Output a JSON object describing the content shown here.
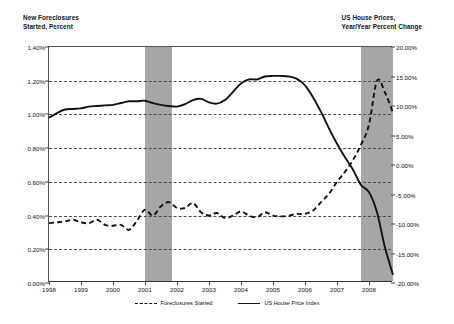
{
  "axes": {
    "left_title": "New Foreclosures\nStarted, Percent",
    "right_title": "US House Prices,\nYear/Year Percent Change"
  },
  "legend": {
    "items": [
      {
        "label": "Foreclosures Started",
        "style": "dashed"
      },
      {
        "label": "US House Price Index",
        "style": "solid"
      }
    ]
  },
  "chart_data": {
    "type": "line",
    "title": "",
    "subtitle": "",
    "xlabel": "",
    "ylabel": "New Foreclosures Started, Percent",
    "y2label": "US House Prices, Year/Year Percent Change",
    "grid": true,
    "legend_position": "bottom",
    "xlim": [
      1998.0,
      2008.75
    ],
    "x_tick_labels": [
      "1998",
      "1999",
      "2000",
      "2001",
      "2002",
      "2003",
      "2004",
      "2005",
      "2006",
      "2007",
      "2008"
    ],
    "x_ticks": [
      1998,
      1999,
      2000,
      2001,
      2002,
      2003,
      2004,
      2005,
      2006,
      2007,
      2008
    ],
    "ylim": [
      0.0,
      1.4
    ],
    "y_tick_labels": [
      "0.00%",
      "0.20%",
      "0.40%",
      "0.60%",
      "0.80%",
      "1.00%",
      "1.20%",
      "1.40%"
    ],
    "y_ticks": [
      0.0,
      0.2,
      0.4,
      0.6,
      0.8,
      1.0,
      1.2,
      1.4
    ],
    "y2lim": [
      -20.0,
      20.0
    ],
    "y2_tick_labels": [
      "-20.00%",
      "-15.00%",
      "-10.00%",
      "-5.00%",
      "0.00%",
      "5.00%",
      "10.00%",
      "15.00%",
      "20.00%"
    ],
    "y2_ticks": [
      -20,
      -15,
      -10,
      -5,
      0,
      5,
      10,
      15,
      20
    ],
    "shaded_regions": [
      {
        "name": "recession-2001",
        "x_start": 2001.0,
        "x_end": 2001.85,
        "color": "#a6a6a6"
      },
      {
        "name": "recession-2007",
        "x_start": 2007.75,
        "x_end": 2008.75,
        "color": "#a6a6a6"
      }
    ],
    "series": [
      {
        "name": "Foreclosures Started",
        "axis": "left",
        "style": "dashed",
        "color": "#111111",
        "x": [
          1998.0,
          1998.25,
          1998.5,
          1998.75,
          1999.0,
          1999.25,
          1999.5,
          1999.75,
          2000.0,
          2000.25,
          2000.5,
          2000.75,
          2001.0,
          2001.25,
          2001.5,
          2001.75,
          2002.0,
          2002.25,
          2002.5,
          2002.75,
          2003.0,
          2003.25,
          2003.5,
          2003.75,
          2004.0,
          2004.25,
          2004.5,
          2004.75,
          2005.0,
          2005.25,
          2005.5,
          2005.75,
          2006.0,
          2006.25,
          2006.5,
          2006.75,
          2007.0,
          2007.25,
          2007.5,
          2007.75,
          2008.0,
          2008.25,
          2008.5,
          2008.75
        ],
        "values": [
          0.355,
          0.36,
          0.365,
          0.375,
          0.36,
          0.355,
          0.375,
          0.345,
          0.34,
          0.345,
          0.315,
          0.37,
          0.435,
          0.4,
          0.455,
          0.48,
          0.445,
          0.445,
          0.475,
          0.42,
          0.4,
          0.415,
          0.385,
          0.4,
          0.425,
          0.4,
          0.39,
          0.42,
          0.4,
          0.395,
          0.4,
          0.41,
          0.41,
          0.43,
          0.48,
          0.53,
          0.6,
          0.66,
          0.73,
          0.82,
          0.94,
          1.2,
          1.13,
          1.01
        ]
      },
      {
        "name": "US House Price Index",
        "axis": "right",
        "style": "solid",
        "color": "#111111",
        "x": [
          1998.0,
          1998.25,
          1998.5,
          1998.75,
          1999.0,
          1999.25,
          1999.5,
          1999.75,
          2000.0,
          2000.25,
          2000.5,
          2000.75,
          2001.0,
          2001.25,
          2001.5,
          2001.75,
          2002.0,
          2002.25,
          2002.5,
          2002.75,
          2003.0,
          2003.25,
          2003.5,
          2003.75,
          2004.0,
          2004.25,
          2004.5,
          2004.75,
          2005.0,
          2005.25,
          2005.5,
          2005.75,
          2006.0,
          2006.25,
          2006.5,
          2006.75,
          2007.0,
          2007.25,
          2007.5,
          2007.75,
          2008.0,
          2008.25,
          2008.5,
          2008.75
        ],
        "values": [
          8.0,
          8.8,
          9.4,
          9.5,
          9.6,
          9.9,
          10.0,
          10.1,
          10.2,
          10.5,
          10.8,
          10.8,
          10.9,
          10.5,
          10.2,
          10.0,
          9.9,
          10.3,
          11.0,
          11.2,
          10.6,
          10.4,
          11.0,
          12.4,
          13.8,
          14.5,
          14.5,
          15.0,
          15.1,
          15.1,
          15.0,
          14.6,
          13.5,
          11.5,
          9.0,
          6.2,
          3.6,
          1.3,
          -0.8,
          -3.4,
          -4.6,
          -8.0,
          -14.0,
          -18.6
        ]
      }
    ]
  }
}
